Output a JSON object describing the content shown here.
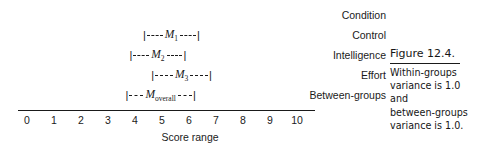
{
  "figure": {
    "caption_title": "Figure 12.4.",
    "caption_lines": [
      "Within-groups",
      "variance is 1.0",
      "and",
      "between-groups",
      "variance is 1.0."
    ]
  },
  "chart_data": {
    "type": "table",
    "title": "",
    "xlabel": "Score range",
    "ylabel": "",
    "xlim": [
      0,
      10
    ],
    "xticks": [
      0,
      1,
      2,
      3,
      4,
      5,
      6,
      7,
      8,
      9,
      10
    ],
    "xticklabels": [
      "0",
      "1",
      "2",
      "3",
      "4",
      "5",
      "6",
      "7",
      "8",
      "9",
      "10"
    ],
    "grid": false,
    "legend": false,
    "axis_style": "single-horizontal-rule",
    "column_header": "Condition",
    "series": [
      {
        "name": "M1",
        "mean_label": "M",
        "mean_subscript": "1",
        "condition": "Control",
        "low": 4.3,
        "high": 6.4,
        "mean": 5.3
      },
      {
        "name": "M2",
        "mean_label": "M",
        "mean_subscript": "2",
        "condition": "Intelligence",
        "low": 3.8,
        "high": 5.9,
        "mean": 4.85
      },
      {
        "name": "M3",
        "mean_label": "M",
        "mean_subscript": "3",
        "condition": "Effort",
        "low": 4.6,
        "high": 6.85,
        "mean": 5.7
      },
      {
        "name": "Moverall",
        "mean_label": "M",
        "mean_subscript": "overall",
        "condition": "Between-groups",
        "low": 3.65,
        "high": 6.25,
        "mean": 4.95
      }
    ]
  }
}
